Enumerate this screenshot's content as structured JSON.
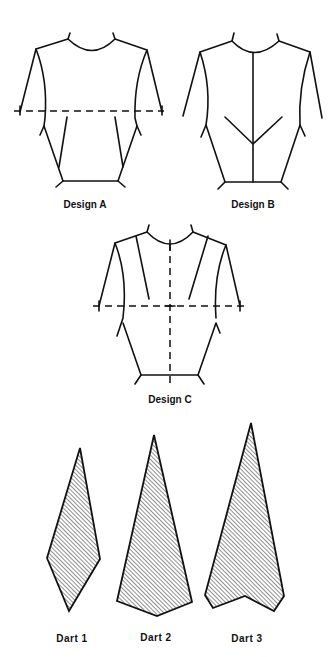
{
  "figure": {
    "designs": [
      {
        "id": "A",
        "label": "Design A"
      },
      {
        "id": "B",
        "label": "Design B"
      },
      {
        "id": "C",
        "label": "Design C"
      }
    ],
    "darts": [
      {
        "id": "1",
        "label": "Dart  1"
      },
      {
        "id": "2",
        "label": "Dart  2"
      },
      {
        "id": "3",
        "label": "Dart  3"
      }
    ],
    "colors": {
      "ink": "#111111",
      "background": "#ffffff",
      "hatch": "#555555"
    }
  }
}
